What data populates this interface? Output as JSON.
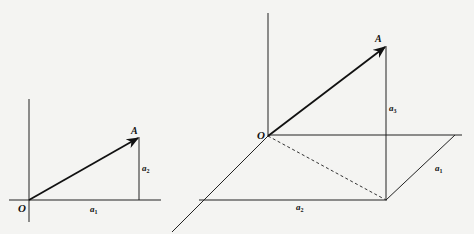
{
  "figure_2d": {
    "title": "Planar vector components",
    "origin_label": "O",
    "point_label": "A",
    "component_x_label": "a",
    "component_x_sub": "1",
    "component_y_label": "a",
    "component_y_sub": "2"
  },
  "figure_3d": {
    "title": "Spatial vector components",
    "origin_label": "O",
    "point_label": "A",
    "component_1_label": "a",
    "component_1_sub": "1",
    "component_2_label": "a",
    "component_2_sub": "2",
    "component_3_label": "a",
    "component_3_sub": "3"
  },
  "colors": {
    "ink": "#111111",
    "paper": "#f4f4f2",
    "bleed_text": "#d9d9d6"
  }
}
